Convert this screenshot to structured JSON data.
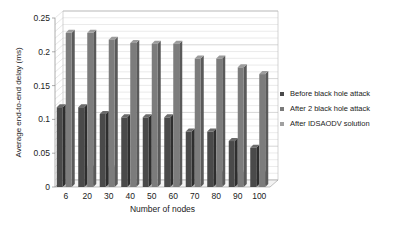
{
  "chart_data": {
    "type": "bar",
    "title": "",
    "xlabel": "Number of nodes",
    "ylabel": "Average end-to-end delay (ms)",
    "ylim": [
      0,
      0.25
    ],
    "yticks": [
      "0",
      "0.05",
      "0.1",
      "0.15",
      "0.2",
      "0.25"
    ],
    "categories": [
      "6",
      "20",
      "30",
      "40",
      "50",
      "60",
      "70",
      "80",
      "90",
      "100"
    ],
    "series": [
      {
        "name": "Before black hole attack",
        "color": "#4a4a4a",
        "values": [
          0.118,
          0.118,
          0.108,
          0.103,
          0.103,
          0.103,
          0.082,
          0.082,
          0.068,
          0.058
        ]
      },
      {
        "name": "After 2 black hole attack",
        "color": "#7a7a7a",
        "values": [
          0.228,
          0.228,
          0.218,
          0.213,
          0.212,
          0.212,
          0.19,
          0.19,
          0.177,
          0.167
        ]
      },
      {
        "name": "After IDSAODV solution",
        "color": "#9a9a9a",
        "values": [
          0.002,
          0.028,
          0.028,
          0.002,
          0.002,
          0.002,
          0.002,
          0.02,
          0.02,
          0.02
        ]
      }
    ],
    "grid": true,
    "legend_position": "right",
    "style": "3d-clustered-bar"
  },
  "legend": {
    "items": [
      "Before black hole attack",
      "After 2 black hole attack",
      "After IDSAODV solution"
    ]
  }
}
